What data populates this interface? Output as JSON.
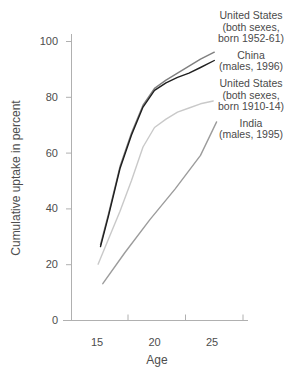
{
  "figure": {
    "background": "#ffffff"
  },
  "chart_data": {
    "type": "line",
    "title": "",
    "xlabel": "Age",
    "ylabel": "Cumulative uptake in percent",
    "xlim": [
      12.5,
      28
    ],
    "ylim": [
      0,
      100
    ],
    "xticks": [
      15,
      20,
      25
    ],
    "yticks": [
      0,
      20,
      40,
      60,
      80,
      100
    ],
    "grid": false,
    "legend_position": "right",
    "axis_color": "#b0b0b0",
    "text_color": "#4d4d4d",
    "series": [
      {
        "name": "United States (both sexes, born 1952-61)",
        "label_lines": [
          "United States",
          "(both sexes,",
          "born 1952-61)"
        ],
        "color": "#7f7f7f",
        "ages": [
          15.3,
          16,
          17,
          18,
          19,
          20,
          21,
          22,
          23,
          24,
          25.2
        ],
        "values": [
          27,
          38,
          55,
          67,
          77,
          83,
          86,
          88.5,
          91,
          93.5,
          96
        ]
      },
      {
        "name": "China (males, 1996)",
        "label_lines": [
          "China",
          "(males, 1996)"
        ],
        "color": "#1f1f1f",
        "ages": [
          15.3,
          16,
          17,
          18,
          19,
          20,
          21,
          22,
          23,
          24,
          25.2
        ],
        "values": [
          26.3,
          37.3,
          54.3,
          66.3,
          76.3,
          82.3,
          85,
          87,
          88.5,
          90.5,
          93
        ]
      },
      {
        "name": "United States (both sexes, born 1910-14)",
        "label_lines": [
          "United States",
          "(both sexes,",
          "born 1910-14)"
        ],
        "color": "#c9c9c9",
        "ages": [
          15.1,
          16,
          17,
          18,
          19,
          20,
          21,
          22,
          23,
          24,
          25.1
        ],
        "values": [
          20,
          29,
          39,
          50,
          62,
          69,
          72,
          74.5,
          76,
          77.5,
          78.5
        ]
      },
      {
        "name": "India (males, 1995)",
        "label_lines": [
          "India",
          "(males, 1995)"
        ],
        "color": "#9c9c9c",
        "ages": [
          15.5,
          17.4,
          19.6,
          21.8,
          24,
          25.4
        ],
        "values": [
          13,
          24,
          36,
          47,
          59,
          71
        ]
      }
    ]
  }
}
